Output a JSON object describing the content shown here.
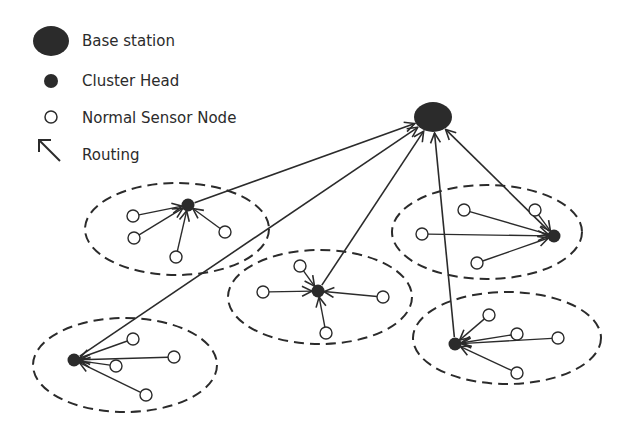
{
  "legend": {
    "items": [
      {
        "icon": "base-station-icon",
        "label": "Base station"
      },
      {
        "icon": "cluster-head-icon",
        "label": "Cluster Head"
      },
      {
        "icon": "sensor-node-icon",
        "label": "Normal Sensor Node"
      },
      {
        "icon": "routing-arrow-icon",
        "label": "Routing"
      }
    ]
  },
  "colors": {
    "ink": "#2b2b2b",
    "node_fill": "#ffffff",
    "background": "#ffffff"
  },
  "base_station": {
    "cx": 433,
    "cy": 117,
    "rx": 19,
    "ry": 15
  },
  "clusters": [
    {
      "name": "cluster-1",
      "ellipse": {
        "cx": 177,
        "cy": 229,
        "rx": 92,
        "ry": 46
      },
      "head": {
        "cx": 188,
        "cy": 205
      },
      "nodes": [
        {
          "cx": 133,
          "cy": 216
        },
        {
          "cx": 134,
          "cy": 238
        },
        {
          "cx": 176,
          "cy": 257
        },
        {
          "cx": 225,
          "cy": 232
        }
      ]
    },
    {
      "name": "cluster-2",
      "ellipse": {
        "cx": 487,
        "cy": 232,
        "rx": 95,
        "ry": 47
      },
      "head": {
        "cx": 554,
        "cy": 236
      },
      "nodes": [
        {
          "cx": 464,
          "cy": 210
        },
        {
          "cx": 422,
          "cy": 234
        },
        {
          "cx": 477,
          "cy": 263
        },
        {
          "cx": 535,
          "cy": 210
        }
      ]
    },
    {
      "name": "cluster-3",
      "ellipse": {
        "cx": 320,
        "cy": 297,
        "rx": 92,
        "ry": 47
      },
      "head": {
        "cx": 318,
        "cy": 291
      },
      "nodes": [
        {
          "cx": 300,
          "cy": 266
        },
        {
          "cx": 263,
          "cy": 292
        },
        {
          "cx": 383,
          "cy": 297
        },
        {
          "cx": 326,
          "cy": 333
        }
      ]
    },
    {
      "name": "cluster-4",
      "ellipse": {
        "cx": 125,
        "cy": 365,
        "rx": 92,
        "ry": 47
      },
      "head": {
        "cx": 74,
        "cy": 360
      },
      "nodes": [
        {
          "cx": 133,
          "cy": 339
        },
        {
          "cx": 174,
          "cy": 357
        },
        {
          "cx": 116,
          "cy": 366
        },
        {
          "cx": 146,
          "cy": 395
        }
      ]
    },
    {
      "name": "cluster-5",
      "ellipse": {
        "cx": 507,
        "cy": 338,
        "rx": 94,
        "ry": 46
      },
      "head": {
        "cx": 455,
        "cy": 344
      },
      "nodes": [
        {
          "cx": 489,
          "cy": 315
        },
        {
          "cx": 517,
          "cy": 334
        },
        {
          "cx": 558,
          "cy": 338
        },
        {
          "cx": 517,
          "cy": 373
        }
      ]
    }
  ]
}
